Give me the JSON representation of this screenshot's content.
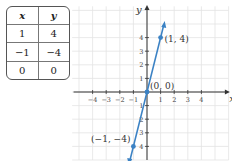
{
  "table": {
    "headers": [
      "x",
      "y"
    ],
    "rows": [
      [
        "1",
        "4"
      ],
      [
        "−1",
        "−4"
      ],
      [
        "0",
        "0"
      ]
    ]
  },
  "chart_data": {
    "type": "line",
    "title": "",
    "xlabel": "x",
    "ylabel": "y",
    "xlim": [
      -4.5,
      5
    ],
    "ylim": [
      -4.5,
      4.5
    ],
    "grid": true,
    "x_ticks": [
      "−4",
      "−3",
      "−2",
      "−1",
      "1",
      "2",
      "3",
      "4"
    ],
    "y_ticks": [
      "4",
      "3",
      "2",
      "1",
      "−1",
      "−2",
      "−3",
      "−4"
    ],
    "series": [
      {
        "name": "y = 4x",
        "x": [
          -1,
          0,
          1
        ],
        "y": [
          -4,
          0,
          4
        ],
        "color": "#3b82c4"
      }
    ],
    "annotations": [
      "(1, 4)",
      "(0, 0)",
      "(−1, −4)"
    ]
  }
}
